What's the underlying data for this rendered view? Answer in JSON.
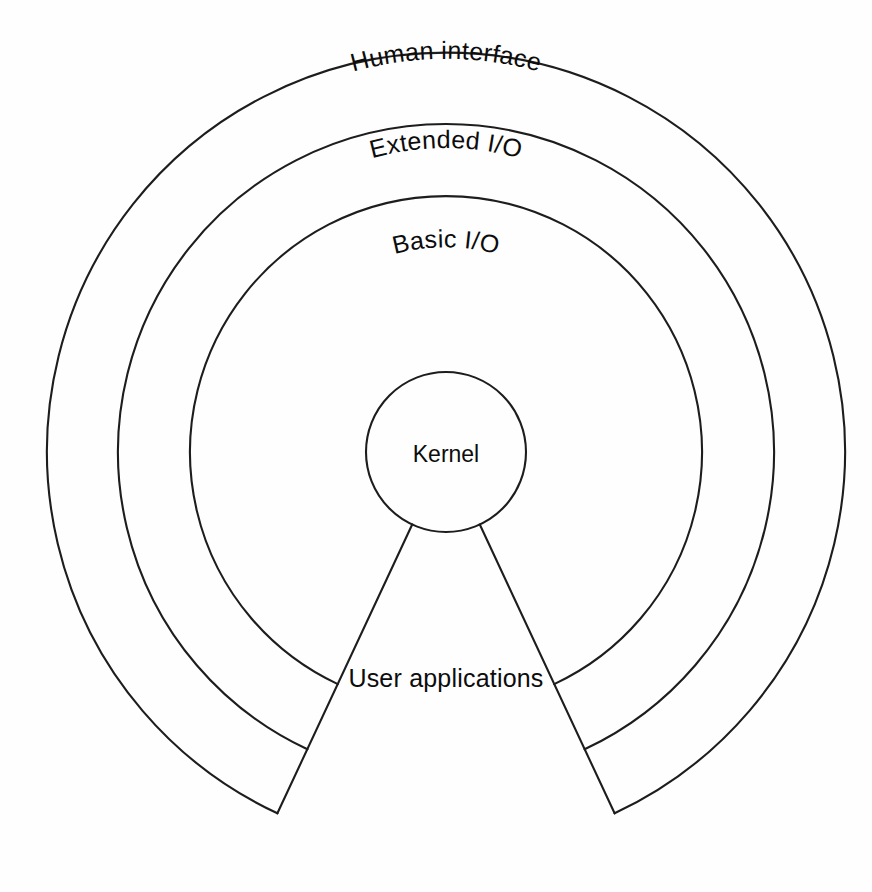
{
  "diagram": {
    "type": "concentric-onion",
    "background_color": "#fefefe",
    "stroke_color": "#1d1d1d",
    "text_color": "#0c0c0c",
    "canvas": {
      "width": 872,
      "height": 892
    },
    "center": {
      "x": 446,
      "y": 452
    },
    "layers": [
      {
        "id": "human-interface",
        "label": "Human interface",
        "outer_radius": 399,
        "inner_radius": 328,
        "label_style": "curved",
        "label_radius": 342,
        "order": 4
      },
      {
        "id": "extended-io",
        "label": "Extended  I/O",
        "outer_radius": 328,
        "inner_radius": 256,
        "label_style": "curved",
        "label_radius": 272,
        "order": 3
      },
      {
        "id": "basic-io",
        "label": "Basic  I/O",
        "outer_radius": 256,
        "inner_radius": 80,
        "label_style": "curved",
        "label_radius": 196,
        "order": 2
      },
      {
        "id": "kernel",
        "label": "Kernel",
        "outer_radius": 80,
        "inner_radius": 0,
        "label_style": "flat",
        "order": 1
      }
    ],
    "wedge": {
      "id": "user-applications",
      "label": "User applications",
      "label_x": 446,
      "label_y": 687,
      "start_angle_deg": 115,
      "end_angle_deg": 65,
      "inner_radius": 80,
      "outer_radius": 399
    }
  }
}
